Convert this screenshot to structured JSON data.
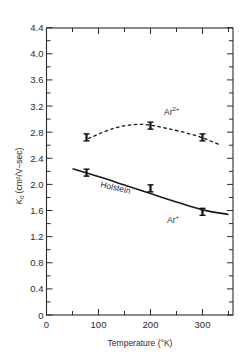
{
  "chart_data": {
    "type": "line",
    "title": "",
    "xlabel": "Temperature (°K)",
    "ylabel_main": "K",
    "ylabel_sub": "0",
    "ylabel_units": "(cm²/V–sec)",
    "xlim": [
      0,
      360
    ],
    "ylim": [
      0,
      4.4
    ],
    "xticks_major": [
      0,
      100,
      200,
      300
    ],
    "xticks_minor": [
      50,
      150,
      250,
      350
    ],
    "yticks_major": [
      0,
      0.4,
      0.8,
      1.2,
      1.6,
      2.0,
      2.4,
      2.8,
      3.2,
      3.6,
      4.0,
      4.4
    ],
    "ytick_labels": [
      "0",
      "0.4",
      "0.8",
      "1.2",
      "1.6",
      "2.0",
      "2.4",
      "2.8",
      "3.2",
      "3.6",
      "4.0",
      "4.4"
    ],
    "xtick_labels": [
      "0",
      "100",
      "200",
      "300"
    ],
    "grid": false,
    "legend": "none (inline annotations)",
    "series": [
      {
        "name": "Ar2+",
        "label": "Ar",
        "label_sup": "2+",
        "style": "dashed",
        "markers": "error-bar",
        "points": [
          {
            "x": 77,
            "y": 2.72
          },
          {
            "x": 200,
            "y": 2.9
          },
          {
            "x": 300,
            "y": 2.72
          }
        ],
        "curve": [
          {
            "x": 80,
            "y": 2.7
          },
          {
            "x": 130,
            "y": 2.86
          },
          {
            "x": 180,
            "y": 2.92
          },
          {
            "x": 230,
            "y": 2.86
          },
          {
            "x": 290,
            "y": 2.74
          },
          {
            "x": 335,
            "y": 2.6
          }
        ]
      },
      {
        "name": "Ar+",
        "label": "Ar",
        "label_sup": "+",
        "style": "solid",
        "markers": "error-bar",
        "points": [
          {
            "x": 77,
            "y": 2.18
          },
          {
            "x": 200,
            "y": 1.94
          },
          {
            "x": 300,
            "y": 1.58
          }
        ],
        "curve": [
          {
            "x": 50,
            "y": 2.24
          },
          {
            "x": 100,
            "y": 2.12
          },
          {
            "x": 150,
            "y": 1.99
          },
          {
            "x": 200,
            "y": 1.86
          },
          {
            "x": 250,
            "y": 1.73
          },
          {
            "x": 300,
            "y": 1.61
          },
          {
            "x": 350,
            "y": 1.54
          }
        ]
      }
    ],
    "annotations": [
      {
        "text": "Holstein",
        "x": 115,
        "y": 1.95,
        "rotation": 13
      },
      {
        "text": "Ar⁺",
        "x": 235,
        "y": 1.45
      },
      {
        "text": "Ar²⁺",
        "x": 230,
        "y": 3.05
      }
    ]
  }
}
